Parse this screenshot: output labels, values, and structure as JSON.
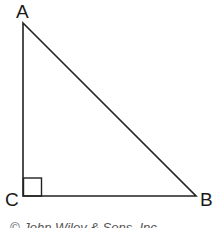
{
  "diagram": {
    "type": "right-triangle",
    "vertices": [
      {
        "name": "A",
        "label": "A",
        "x": 23,
        "y": 23
      },
      {
        "name": "B",
        "label": "B",
        "x": 196,
        "y": 196
      },
      {
        "name": "C",
        "label": "C",
        "x": 23,
        "y": 196
      }
    ],
    "right_angle_at": "C",
    "stroke_color": "#222222"
  },
  "labels": {
    "a": "A",
    "b": "B",
    "c": "C"
  },
  "copyright": "© John Wiley & Sons, Inc."
}
